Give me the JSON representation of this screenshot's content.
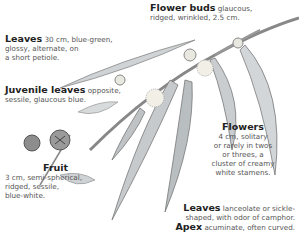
{
  "labels": {
    "flower_buds": {
      "title": "Flower buds",
      "text1": "glaucous,",
      "text2": "ridged, wrinkled, 2.5 cm."
    },
    "leaves_top": {
      "title": "Leaves",
      "text1": "30 cm, blue-green,",
      "text2": "glossy, alternate, on",
      "text3": "a short petiole."
    },
    "juvenile": {
      "title": "Juvenile leaves",
      "text1": "opposite,",
      "text2": "sessile, glaucous blue."
    },
    "fruit": {
      "title": "Fruit",
      "text1": "3 cm, semi-spherical,",
      "text2": "ridged, sessile,",
      "text3": "blue-white."
    },
    "flowers": {
      "title": "Flowers",
      "text1": "4 cm, solitary",
      "text2": "or rarely in twos",
      "text3": "or threes, a",
      "text4": "cluster of creamy",
      "text5": "white stamens."
    },
    "leaves_bottom": {
      "title": "Leaves",
      "text1": "lanceolate or sickle-",
      "text2": "shaped, with odor of camphor."
    },
    "apex": {
      "title": "Apex",
      "text1": "acuminate, often curved."
    }
  }
}
